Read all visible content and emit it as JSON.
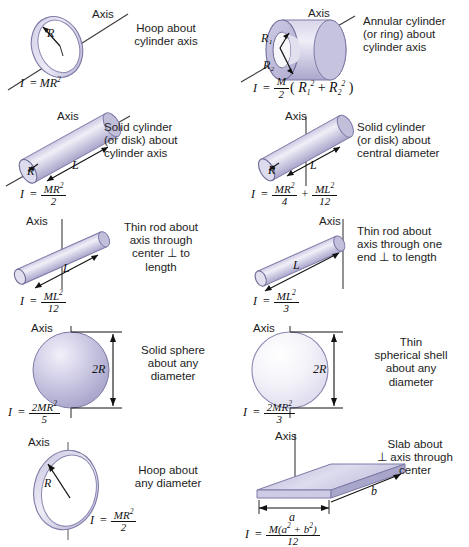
{
  "sheet": {
    "title": "Moments of inertia of common shapes",
    "background": "#ffffff",
    "body_fill_dark": "#b9b6da",
    "body_fill_light": "#e9e8f4",
    "outline": "#6f6d96"
  },
  "axis_label": "Axis",
  "panels": [
    {
      "id": "hoop-cylinder-axis",
      "shape": "hoop",
      "caption": "Hoop about\ncylinder axis",
      "dimension_labels": [
        "R"
      ],
      "formula": {
        "lhs": "I",
        "type": "simple",
        "expr": "MR²",
        "numerator": "MR²",
        "denominator": ""
      }
    },
    {
      "id": "annular-cylinder",
      "shape": "annular-cylinder",
      "caption": "Annular cylinder\n(or ring) about\ncylinder axis",
      "dimension_labels": [
        "R₁",
        "R₂"
      ],
      "formula": {
        "lhs": "I",
        "type": "fraction-paren",
        "numerator": "M",
        "denominator": "2",
        "paren": "( R₁² + R₂² )"
      }
    },
    {
      "id": "solid-cylinder-cylinder-axis",
      "shape": "cylinder-tilted",
      "caption": "Solid cylinder\n(or disk) about\ncylinder axis",
      "dimension_labels": [
        "R",
        "L"
      ],
      "formula": {
        "lhs": "I",
        "type": "fraction",
        "numerator": "MR²",
        "denominator": "2"
      }
    },
    {
      "id": "solid-cylinder-central-diameter",
      "shape": "cylinder-tilted-vertical-axis",
      "caption": "Solid cylinder\n(or disk) about\ncentral diameter",
      "dimension_labels": [
        "R",
        "L"
      ],
      "formula": {
        "lhs": "I",
        "type": "two-fractions",
        "numerator1": "MR²",
        "denominator1": "4",
        "operator": "+",
        "numerator2": "ML²",
        "denominator2": "12"
      }
    },
    {
      "id": "thin-rod-center",
      "shape": "rod-tilted-vertical-axis-center",
      "caption": "Thin rod about\naxis through\ncenter ⊥ to\nlength",
      "dimension_labels": [
        "L"
      ],
      "formula": {
        "lhs": "I",
        "type": "fraction",
        "numerator": "ML²",
        "denominator": "12"
      }
    },
    {
      "id": "thin-rod-end",
      "shape": "rod-tilted-vertical-axis-end",
      "caption": "Thin rod about\naxis through one\nend ⊥ to length",
      "dimension_labels": [
        "L"
      ],
      "formula": {
        "lhs": "I",
        "type": "fraction",
        "numerator": "ML²",
        "denominator": "3"
      }
    },
    {
      "id": "solid-sphere",
      "shape": "solid-sphere",
      "caption": "Solid sphere\nabout any\ndiameter",
      "dimension_labels": [
        "2R"
      ],
      "formula": {
        "lhs": "I",
        "type": "fraction",
        "numerator": "2MR²",
        "denominator": "5"
      }
    },
    {
      "id": "thin-spherical-shell",
      "shape": "thin-spherical-shell",
      "caption": "Thin\nspherical shell\nabout any\ndiameter",
      "dimension_labels": [
        "2R"
      ],
      "formula": {
        "lhs": "I",
        "type": "fraction",
        "numerator": "2MR²",
        "denominator": "3"
      }
    },
    {
      "id": "hoop-any-diameter",
      "shape": "hoop-vertical-axis",
      "caption": "Hoop about\nany diameter",
      "dimension_labels": [
        "R"
      ],
      "formula": {
        "lhs": "I",
        "type": "fraction",
        "numerator": "MR²",
        "denominator": "2"
      }
    },
    {
      "id": "slab",
      "shape": "slab",
      "caption": "Slab about\n⊥ axis through\ncenter",
      "dimension_labels": [
        "a",
        "b"
      ],
      "formula": {
        "lhs": "I",
        "type": "fraction",
        "numerator": "M(a² + b²)",
        "denominator": "12"
      }
    }
  ]
}
